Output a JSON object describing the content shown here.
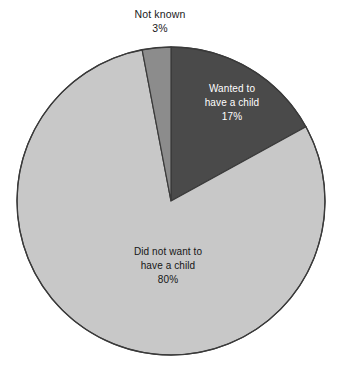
{
  "chart_data": {
    "type": "pie",
    "title": "",
    "categories": [
      "Wanted to have a child",
      "Did not want to have a child",
      "Not known"
    ],
    "values": [
      17,
      80,
      3
    ],
    "value_unit": "%",
    "legend_position": "none",
    "labels_inside": [
      true,
      true,
      false
    ],
    "slice_colors": [
      "#4a4a4a",
      "#c8c8c8",
      "#8c8c8c"
    ],
    "start_angle_deg": 0,
    "direction": "clockwise"
  },
  "colors": {
    "background": "#ffffff",
    "wanted_fill": "#4a4a4a",
    "did_not_want_fill": "#c8c8c8",
    "not_known_fill": "#8c8c8c",
    "outline": "#3a3a3a",
    "text_on_dark": "#ffffff",
    "text_on_light": "#161616"
  },
  "labels": {
    "not_known": {
      "name": "Not known",
      "percent": "3%"
    },
    "wanted": {
      "line1": "Wanted to",
      "line2": "have a child",
      "percent": "17%"
    },
    "did_not_want": {
      "line1": "Did not want to",
      "line2": "have a child",
      "percent": "80%"
    }
  }
}
